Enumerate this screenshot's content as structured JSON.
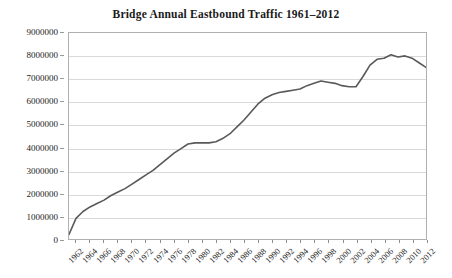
{
  "chart_data": {
    "type": "line",
    "title": "Bridge Annual Eastbound Traffic 1961–2012",
    "xlabel": "",
    "ylabel": "",
    "ylim": [
      0,
      9000000
    ],
    "xlim": [
      1961,
      2012
    ],
    "grid": true,
    "legend": false,
    "y_ticks": [
      0,
      1000000,
      2000000,
      3000000,
      4000000,
      5000000,
      6000000,
      7000000,
      8000000,
      9000000
    ],
    "y_tick_labels": [
      "0",
      "1000000",
      "2000000",
      "3000000",
      "4000000",
      "5000000",
      "6000000",
      "7000000",
      "8000000",
      "9000000"
    ],
    "x_tick_labels": [
      "1962",
      "1964",
      "1966",
      "1968",
      "1970",
      "1972",
      "1974",
      "1976",
      "1978",
      "1980",
      "1982",
      "1984",
      "1986",
      "1988",
      "1990",
      "1992",
      "1994",
      "1996",
      "1998",
      "2000",
      "2002",
      "2004",
      "2006",
      "2008",
      "2010",
      "2012"
    ],
    "x": [
      1961,
      1962,
      1963,
      1964,
      1965,
      1966,
      1967,
      1968,
      1969,
      1970,
      1971,
      1972,
      1973,
      1974,
      1975,
      1976,
      1977,
      1978,
      1979,
      1980,
      1981,
      1982,
      1983,
      1984,
      1985,
      1986,
      1987,
      1988,
      1989,
      1990,
      1991,
      1992,
      1993,
      1994,
      1995,
      1996,
      1997,
      1998,
      1999,
      2000,
      2001,
      2002,
      2003,
      2004,
      2005,
      2006,
      2007,
      2008,
      2009,
      2010,
      2011,
      2012
    ],
    "values": [
      200000,
      900000,
      1200000,
      1400000,
      1550000,
      1700000,
      1900000,
      2050000,
      2200000,
      2400000,
      2600000,
      2800000,
      3000000,
      3250000,
      3500000,
      3750000,
      3950000,
      4150000,
      4200000,
      4200000,
      4200000,
      4250000,
      4400000,
      4600000,
      4900000,
      5200000,
      5550000,
      5900000,
      6150000,
      6300000,
      6400000,
      6450000,
      6500000,
      6550000,
      6700000,
      6800000,
      6900000,
      6850000,
      6800000,
      6700000,
      6650000,
      6650000,
      7100000,
      7600000,
      7850000,
      7900000,
      8050000,
      7950000,
      8000000,
      7900000,
      7700000,
      7500000
    ],
    "series_color": "#595959",
    "grid_color": "#d9d9d9",
    "frame_color": "#b0b0b0",
    "text_color": "#1c1c1c"
  }
}
